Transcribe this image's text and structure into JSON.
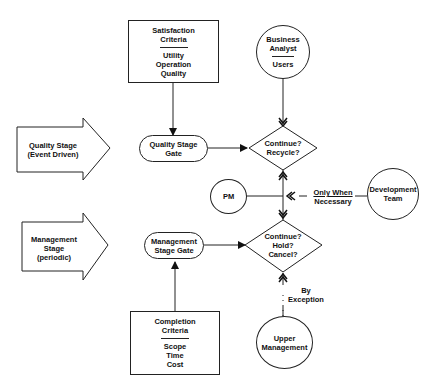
{
  "diagram": {
    "satisfaction_box": {
      "title": [
        "Satisfaction",
        "Criteria"
      ],
      "items": [
        "Utility",
        "Operation",
        "Quality"
      ]
    },
    "completion_box": {
      "title": [
        "Completion",
        "Criteria"
      ],
      "items": [
        "Scope",
        "Time",
        "Cost"
      ]
    },
    "business_analyst": {
      "title": [
        "Business",
        "Analyst"
      ],
      "sub": "Users"
    },
    "quality_arrow": [
      "Quality Stage",
      "(Event Driven)"
    ],
    "management_arrow": [
      "Management",
      "Stage",
      "(periodic)"
    ],
    "quality_gate": [
      "Quality Stage",
      "Gate"
    ],
    "management_gate": [
      "Management",
      "Stage Gate"
    ],
    "decision_quality": [
      "Continue?",
      "Recycle?"
    ],
    "decision_management": [
      "Continue?",
      "Hold?",
      "Cancel?"
    ],
    "pm": "PM",
    "development_team": [
      "Development",
      "Team"
    ],
    "only_when": [
      "Only When",
      "Necessary"
    ],
    "by_exception": [
      "By",
      "Exception"
    ],
    "upper_management": [
      "Upper",
      "Management"
    ]
  }
}
